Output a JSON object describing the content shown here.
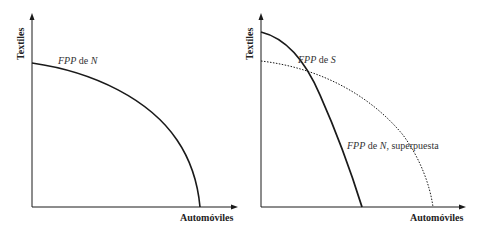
{
  "panels": [
    {
      "id": "left",
      "y_axis_label": "Textiles",
      "x_axis_label": "Automóviles",
      "curves": [
        {
          "label_italic": "FPP",
          "label_rest": " de ",
          "label_italic2": "N",
          "label_tail": "",
          "style": "solid"
        }
      ]
    },
    {
      "id": "right",
      "y_axis_label": "Textiles",
      "x_axis_label": "Automóviles",
      "curves": [
        {
          "label_italic": "FPP",
          "label_rest": " de ",
          "label_italic2": "S",
          "label_tail": "",
          "style": "solid"
        },
        {
          "label_italic": "FPP",
          "label_rest": " de ",
          "label_italic2": "N",
          "label_tail": ", superpuesta",
          "style": "dotted"
        }
      ]
    }
  ],
  "colors": {
    "line": "#1a1a1a",
    "text": "#222222",
    "background": "#ffffff"
  }
}
